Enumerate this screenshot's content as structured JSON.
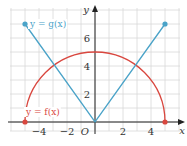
{
  "chart_data": {
    "type": "line",
    "title": "",
    "xlabel": "x",
    "ylabel": "y",
    "origin_label": "O",
    "xlim": [
      -6,
      6
    ],
    "ylim": [
      -0.8,
      8
    ],
    "x_ticks": [
      -4,
      -2,
      2,
      4
    ],
    "x_tick_labels": [
      "−4",
      "−2",
      "2",
      "4"
    ],
    "y_ticks": [
      2,
      4,
      6
    ],
    "y_tick_labels": [
      "2",
      "4",
      "6"
    ],
    "grid": true,
    "series": [
      {
        "name": "y = f(x)",
        "label": "y = f(x)",
        "color": "#d9473f",
        "shape": "semicircle",
        "description": "upper semicircle of radius 5 centered at origin",
        "x": [
          -5,
          -4,
          -3,
          -2,
          -1,
          0,
          1,
          2,
          3,
          4,
          5
        ],
        "values": [
          0,
          3,
          4,
          4.58,
          4.9,
          5,
          4.9,
          4.58,
          4,
          3,
          0
        ],
        "endpoints": [
          [
            -5,
            0
          ],
          [
            5,
            0
          ]
        ],
        "endpoint_style": "closed"
      },
      {
        "name": "y = g(x)",
        "label": "y = g(x)",
        "color": "#4aa3c8",
        "shape": "v",
        "description": "absolute value style V through origin, slope ±7/5",
        "x": [
          -5,
          0,
          5
        ],
        "values": [
          7,
          0,
          7
        ],
        "endpoints": [
          [
            -5,
            7
          ],
          [
            5,
            7
          ]
        ],
        "endpoint_style": "closed"
      }
    ],
    "intersections": [
      [
        -3,
        4
      ],
      [
        3,
        4
      ]
    ]
  },
  "colors": {
    "grid": "#d8d8d8",
    "axis": "#222222",
    "f_color": "#d9473f",
    "g_color": "#4aa3c8"
  }
}
